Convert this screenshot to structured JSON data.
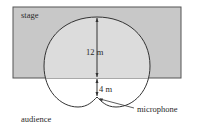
{
  "diagram": {
    "labels": {
      "stage": "stage",
      "audience": "audience",
      "microphone": "microphone",
      "upper_distance": "12 m",
      "lower_distance": "4 m"
    },
    "colors": {
      "stage_fill": "#c8c8c8",
      "stage_border": "#555555",
      "lobe_fill": "#d9d9d9",
      "line": "#333333"
    },
    "geometry": {
      "shape": "cardioid",
      "total_length_m": 16,
      "stage_front_offset_from_mic_m": 4
    }
  }
}
